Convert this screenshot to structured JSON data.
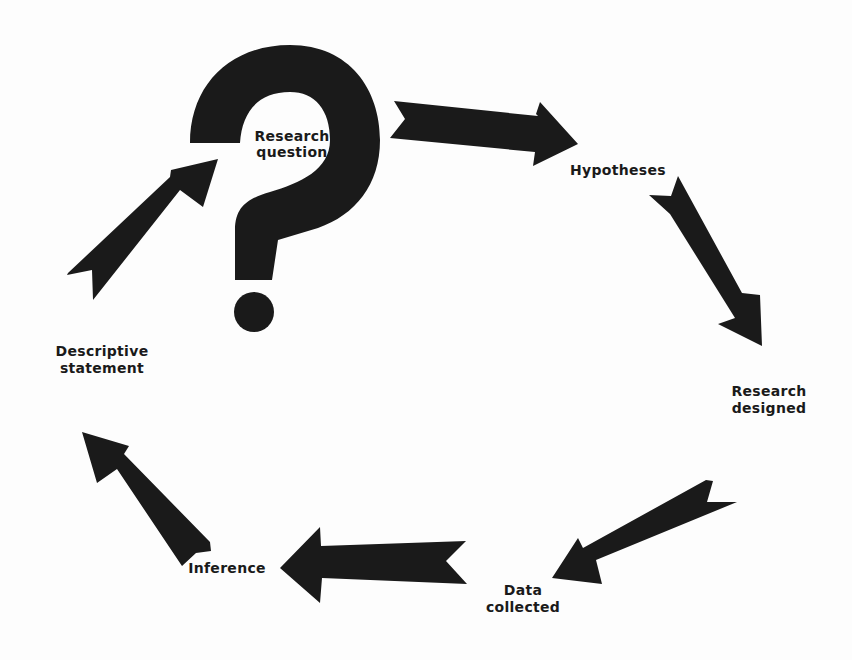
{
  "diagram": {
    "type": "cycle",
    "colors": {
      "ink": "#1a1a1a",
      "background": "#fdfdfd"
    },
    "nodes": [
      {
        "id": "research-question",
        "line1": "Research",
        "line2": "question"
      },
      {
        "id": "hypotheses",
        "line1": "Hypotheses"
      },
      {
        "id": "research-designed",
        "line1": "Research",
        "line2": "designed"
      },
      {
        "id": "data-collected",
        "line1": "Data",
        "line2": "collected"
      },
      {
        "id": "inference",
        "line1": "Inference"
      },
      {
        "id": "descriptive-statement",
        "line1": "Descriptive",
        "line2": "statement"
      }
    ],
    "edges": [
      {
        "from": "research-question",
        "to": "hypotheses"
      },
      {
        "from": "hypotheses",
        "to": "research-designed"
      },
      {
        "from": "research-designed",
        "to": "data-collected"
      },
      {
        "from": "data-collected",
        "to": "inference"
      },
      {
        "from": "inference",
        "to": "descriptive-statement"
      },
      {
        "from": "descriptive-statement",
        "to": "research-question"
      }
    ],
    "center_icon": "question-mark-icon"
  }
}
